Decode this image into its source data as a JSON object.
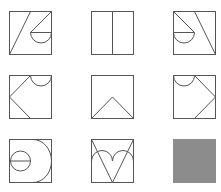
{
  "puzzle": {
    "type": "3x3 figure matrix",
    "rows": 3,
    "cols": 3,
    "stroke_color": "#555555",
    "background_color": "#ffffff",
    "missing_cell_color": "#8c8c8c",
    "cells": [
      {
        "row": 1,
        "col": 1,
        "description": "square with slanted line bottom-left to top-middle; diagonal from top-right corner to center, horizontal radius to right edge, lower semicircle"
      },
      {
        "row": 1,
        "col": 2,
        "description": "square split by a vertical center line"
      },
      {
        "row": 1,
        "col": 3,
        "description": "square with diagonal from top-left corner to center, horizontal radius to left edge, lower semicircle; slanted line top-middle to bottom-right"
      },
      {
        "row": 2,
        "col": 1,
        "description": "square with left-pointing chevron from top-middle to left-middle to bottom-middle; semicircle hanging from top edge on right half"
      },
      {
        "row": 2,
        "col": 2,
        "description": "square with upward chevron from bottom-left to center to bottom-right"
      },
      {
        "row": 2,
        "col": 3,
        "description": "square with semicircle hanging from top edge on left half; right-pointing chevron from top-middle to right-middle to bottom-middle"
      },
      {
        "row": 3,
        "col": 1,
        "description": "square with large right-facing semicircle and small circle with horizontal diameter on left"
      },
      {
        "row": 3,
        "col": 2,
        "description": "square with V from top corners to bottom middle and two upward arches across the middle"
      },
      {
        "row": 3,
        "col": 3,
        "description": "missing cell shown as solid gray square"
      }
    ]
  }
}
